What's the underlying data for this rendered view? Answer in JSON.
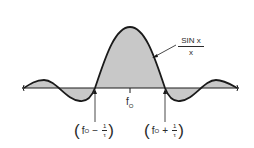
{
  "diagram": {
    "curve_label": {
      "numerator": "SIN x",
      "denominator": "x"
    },
    "center_label": {
      "base": "f",
      "subscript": "O"
    },
    "left_zero_label": {
      "open": "(",
      "base": "f",
      "subscript": "O",
      "operator": "−",
      "frac_num": "1",
      "frac_den": "τ",
      "close": ")"
    },
    "right_zero_label": {
      "open": "(",
      "base": "f",
      "subscript": "O",
      "operator": "+",
      "frac_num": "1",
      "frac_den": "τ",
      "close": ")"
    },
    "colors": {
      "stroke": "#1a1a1a",
      "fill": "#c8c8c8",
      "background": "#ffffff"
    }
  }
}
